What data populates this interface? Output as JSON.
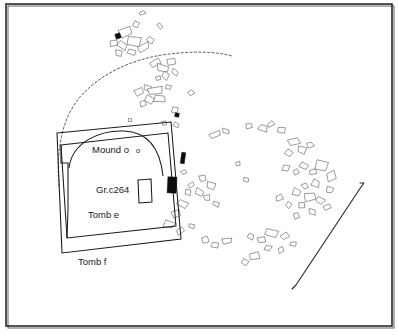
{
  "figure": {
    "kind": "archaeological-site-plan",
    "background_color": "#ffffff",
    "ink_color": "#1a1a1a",
    "frame": {
      "visible": true,
      "x": 6,
      "y": 4,
      "width": 386,
      "height": 322,
      "border_color": "#2a2a2a",
      "shadow_color": "#6e6e6e"
    }
  },
  "labels": [
    {
      "id": "mound-o",
      "text": "Mound o",
      "x": 92,
      "y": 150,
      "size": "normal"
    },
    {
      "id": "mound-o-sub",
      "text": "o",
      "x": 136,
      "y": 151,
      "size": "small"
    },
    {
      "id": "gr-c264",
      "text": "Gr.c264",
      "x": 96,
      "y": 190,
      "size": "normal"
    },
    {
      "id": "tomb-e",
      "text": "Tomb e",
      "x": 88,
      "y": 215,
      "size": "normal"
    },
    {
      "id": "tomb-f",
      "text": "Tomb f",
      "x": 78,
      "y": 262,
      "size": "normal"
    }
  ],
  "structures": {
    "tomb_f_outline": "M 57,133 L 171,122 L 181,239 L 62,253 Z",
    "tomb_e_outline": "M 61,145 L 168,133 L 176,226 L 67,238 Z",
    "tomb_left_notch": "M 61,145 L 61,163 L 68,163 L 68,210 L 67,238",
    "mound_arc": "M 69,168 C 72,142 100,130 124,131 C 148,132 160,148 163,176",
    "grave_box": "M 138,180 L 151,179 L 152,202 L 139,203 Z"
  },
  "dashed_arc": {
    "description": "large dashed enclosure arc sweeping from lower-left over the mound to the upper-right",
    "path": "M 59,186 C 56,150 62,118 80,97 C 100,74 131,60 162,55 C 190,51 214,51 232,56"
  },
  "section_line": {
    "description": "long straight section line with hooked terminals at lower right",
    "path": "M 292,289 L 296,285 L 361,187 L 364,183 L 360,183"
  },
  "solid_markers": [
    {
      "id": "marker-upper-left",
      "x": 118,
      "y": 36,
      "w": 5,
      "h": 5,
      "rot": -20
    },
    {
      "id": "marker-center",
      "x": 177,
      "y": 115,
      "w": 4,
      "h": 4,
      "rot": 12
    },
    {
      "id": "marker-upper-bar",
      "x": 183,
      "y": 158,
      "w": 4,
      "h": 11,
      "rot": 8
    },
    {
      "id": "marker-lower-bar",
      "x": 172,
      "y": 185,
      "w": 9,
      "h": 16,
      "rot": 3
    }
  ],
  "stone_clusters": [
    {
      "id": "cluster-upper-left",
      "note": "dense group of rectangular stone outlines at top-left of plan",
      "stones": [
        {
          "x": 125,
          "y": 32,
          "w": 11,
          "h": 9,
          "rot": -18
        },
        {
          "x": 135,
          "y": 41,
          "w": 13,
          "h": 8,
          "rot": 12
        },
        {
          "x": 122,
          "y": 45,
          "w": 9,
          "h": 7,
          "rot": 35
        },
        {
          "x": 113,
          "y": 43,
          "w": 7,
          "h": 6,
          "rot": -5
        },
        {
          "x": 131,
          "y": 52,
          "w": 8,
          "h": 5,
          "rot": 20
        },
        {
          "x": 144,
          "y": 47,
          "w": 10,
          "h": 6,
          "rot": -25
        },
        {
          "x": 150,
          "y": 40,
          "w": 7,
          "h": 5,
          "rot": 40
        },
        {
          "x": 119,
          "y": 53,
          "w": 6,
          "h": 5,
          "rot": 8
        },
        {
          "x": 142,
          "y": 13,
          "w": 6,
          "h": 3,
          "rot": -20
        },
        {
          "x": 136,
          "y": 24,
          "w": 5,
          "h": 6,
          "rot": 30
        },
        {
          "x": 160,
          "y": 26,
          "w": 4,
          "h": 5,
          "rot": -40
        }
      ]
    },
    {
      "id": "cluster-upper-mid",
      "note": "stones along the dashed arc above the mound",
      "stones": [
        {
          "x": 155,
          "y": 63,
          "w": 9,
          "h": 6,
          "rot": -30
        },
        {
          "x": 163,
          "y": 68,
          "w": 11,
          "h": 6,
          "rot": 15
        },
        {
          "x": 171,
          "y": 62,
          "w": 7,
          "h": 5,
          "rot": -10
        },
        {
          "x": 166,
          "y": 76,
          "w": 6,
          "h": 6,
          "rot": 25
        },
        {
          "x": 158,
          "y": 78,
          "w": 5,
          "h": 4,
          "rot": -15
        },
        {
          "x": 175,
          "y": 72,
          "w": 6,
          "h": 4,
          "rot": 35
        }
      ]
    },
    {
      "id": "cluster-mid",
      "note": "scatter between mound arc and centre of plan",
      "stones": [
        {
          "x": 139,
          "y": 92,
          "w": 7,
          "h": 6,
          "rot": -28
        },
        {
          "x": 147,
          "y": 88,
          "w": 6,
          "h": 5,
          "rot": 18
        },
        {
          "x": 155,
          "y": 91,
          "w": 12,
          "h": 6,
          "rot": -8
        },
        {
          "x": 160,
          "y": 99,
          "w": 11,
          "h": 6,
          "rot": 6
        },
        {
          "x": 150,
          "y": 100,
          "w": 8,
          "h": 6,
          "rot": 30
        },
        {
          "x": 143,
          "y": 104,
          "w": 5,
          "h": 5,
          "rot": -22
        },
        {
          "x": 168,
          "y": 87,
          "w": 5,
          "h": 4,
          "rot": 14
        },
        {
          "x": 191,
          "y": 93,
          "w": 5,
          "h": 4,
          "rot": -35
        },
        {
          "x": 175,
          "y": 110,
          "w": 5,
          "h": 5,
          "rot": 20
        },
        {
          "x": 164,
          "y": 123,
          "w": 4,
          "h": 4,
          "rot": -12
        },
        {
          "x": 176,
          "y": 125,
          "w": 5,
          "h": 4,
          "rot": 28
        },
        {
          "x": 130,
          "y": 120,
          "w": 3,
          "h": 3,
          "rot": 0
        }
      ]
    },
    {
      "id": "cluster-right-upper",
      "note": "scattered stones right of the tomb, upper band",
      "stones": [
        {
          "x": 215,
          "y": 135,
          "w": 9,
          "h": 5,
          "rot": -20
        },
        {
          "x": 226,
          "y": 131,
          "w": 7,
          "h": 4,
          "rot": 14
        },
        {
          "x": 249,
          "y": 126,
          "w": 6,
          "h": 5,
          "rot": -8
        },
        {
          "x": 263,
          "y": 128,
          "w": 8,
          "h": 5,
          "rot": 22
        },
        {
          "x": 271,
          "y": 124,
          "w": 6,
          "h": 4,
          "rot": -30
        },
        {
          "x": 281,
          "y": 130,
          "w": 7,
          "h": 5,
          "rot": 10
        },
        {
          "x": 294,
          "y": 142,
          "w": 10,
          "h": 7,
          "rot": -15
        },
        {
          "x": 302,
          "y": 150,
          "w": 9,
          "h": 6,
          "rot": 18
        },
        {
          "x": 289,
          "y": 153,
          "w": 6,
          "h": 5,
          "rot": 32
        },
        {
          "x": 310,
          "y": 145,
          "w": 6,
          "h": 5,
          "rot": -25
        }
      ]
    },
    {
      "id": "cluster-right-lower",
      "note": "dense scatter on the right-hand side of the plan",
      "stones": [
        {
          "x": 286,
          "y": 168,
          "w": 6,
          "h": 5,
          "rot": 12
        },
        {
          "x": 296,
          "y": 172,
          "w": 5,
          "h": 5,
          "rot": -18
        },
        {
          "x": 304,
          "y": 166,
          "w": 8,
          "h": 6,
          "rot": 25
        },
        {
          "x": 313,
          "y": 172,
          "w": 6,
          "h": 5,
          "rot": -10
        },
        {
          "x": 322,
          "y": 166,
          "w": 11,
          "h": 10,
          "rot": 8
        },
        {
          "x": 331,
          "y": 176,
          "w": 9,
          "h": 7,
          "rot": -22
        },
        {
          "x": 316,
          "y": 183,
          "w": 7,
          "h": 6,
          "rot": 16
        },
        {
          "x": 305,
          "y": 186,
          "w": 6,
          "h": 5,
          "rot": -30
        },
        {
          "x": 296,
          "y": 192,
          "w": 7,
          "h": 6,
          "rot": 20
        },
        {
          "x": 310,
          "y": 197,
          "w": 9,
          "h": 7,
          "rot": -12
        },
        {
          "x": 320,
          "y": 200,
          "w": 8,
          "h": 6,
          "rot": 28
        },
        {
          "x": 302,
          "y": 205,
          "w": 6,
          "h": 5,
          "rot": -5
        },
        {
          "x": 289,
          "y": 205,
          "w": 5,
          "h": 5,
          "rot": 35
        },
        {
          "x": 279,
          "y": 198,
          "w": 6,
          "h": 5,
          "rot": -20
        },
        {
          "x": 330,
          "y": 190,
          "w": 6,
          "h": 5,
          "rot": 14
        },
        {
          "x": 327,
          "y": 207,
          "w": 7,
          "h": 5,
          "rot": -26
        },
        {
          "x": 312,
          "y": 212,
          "w": 6,
          "h": 5,
          "rot": 10
        },
        {
          "x": 296,
          "y": 216,
          "w": 5,
          "h": 5,
          "rot": -14
        }
      ]
    },
    {
      "id": "cluster-left-mid",
      "note": "small group just left of centre below the tomb edge",
      "stones": [
        {
          "x": 203,
          "y": 178,
          "w": 6,
          "h": 5,
          "rot": -18
        },
        {
          "x": 211,
          "y": 186,
          "w": 8,
          "h": 6,
          "rot": 12
        },
        {
          "x": 199,
          "y": 192,
          "w": 7,
          "h": 6,
          "rot": 30
        },
        {
          "x": 207,
          "y": 198,
          "w": 6,
          "h": 5,
          "rot": -8
        },
        {
          "x": 216,
          "y": 204,
          "w": 6,
          "h": 5,
          "rot": 22
        },
        {
          "x": 191,
          "y": 185,
          "w": 5,
          "h": 4,
          "rot": -32
        },
        {
          "x": 246,
          "y": 180,
          "w": 5,
          "h": 4,
          "rot": 16
        },
        {
          "x": 238,
          "y": 164,
          "w": 4,
          "h": 4,
          "rot": -10
        }
      ]
    },
    {
      "id": "cluster-tomb-edge",
      "note": "stones hugging the right edge of the tomb enclosure",
      "stones": [
        {
          "x": 184,
          "y": 172,
          "w": 5,
          "h": 4,
          "rot": -24
        },
        {
          "x": 188,
          "y": 192,
          "w": 5,
          "h": 5,
          "rot": 10
        },
        {
          "x": 182,
          "y": 204,
          "w": 9,
          "h": 6,
          "rot": 28
        },
        {
          "x": 176,
          "y": 214,
          "w": 8,
          "h": 6,
          "rot": -16
        },
        {
          "x": 169,
          "y": 224,
          "w": 10,
          "h": 7,
          "rot": 18
        },
        {
          "x": 180,
          "y": 231,
          "w": 7,
          "h": 5,
          "rot": -30
        },
        {
          "x": 192,
          "y": 226,
          "w": 5,
          "h": 4,
          "rot": 12
        }
      ]
    },
    {
      "id": "cluster-bottom",
      "note": "lower scatter across the bottom of the plan",
      "stones": [
        {
          "x": 205,
          "y": 240,
          "w": 7,
          "h": 5,
          "rot": -20
        },
        {
          "x": 215,
          "y": 245,
          "w": 6,
          "h": 5,
          "rot": 14
        },
        {
          "x": 227,
          "y": 241,
          "w": 8,
          "h": 5,
          "rot": -8
        },
        {
          "x": 251,
          "y": 236,
          "w": 6,
          "h": 5,
          "rot": 26
        },
        {
          "x": 261,
          "y": 240,
          "w": 7,
          "h": 5,
          "rot": -14
        },
        {
          "x": 272,
          "y": 233,
          "w": 11,
          "h": 7,
          "rot": 10
        },
        {
          "x": 285,
          "y": 236,
          "w": 7,
          "h": 5,
          "rot": -24
        },
        {
          "x": 268,
          "y": 248,
          "w": 6,
          "h": 5,
          "rot": 18
        },
        {
          "x": 255,
          "y": 256,
          "w": 9,
          "h": 7,
          "rot": -6
        },
        {
          "x": 245,
          "y": 262,
          "w": 6,
          "h": 5,
          "rot": 30
        },
        {
          "x": 281,
          "y": 250,
          "w": 6,
          "h": 5,
          "rot": -18
        },
        {
          "x": 293,
          "y": 244,
          "w": 5,
          "h": 4,
          "rot": 8
        }
      ]
    }
  ]
}
